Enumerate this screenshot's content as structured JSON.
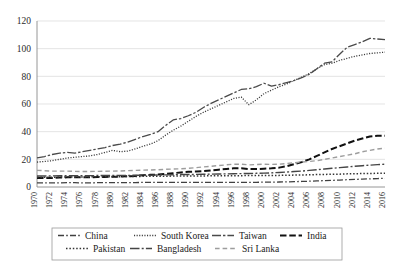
{
  "chart_data": {
    "type": "line",
    "title": "",
    "xlabel": "",
    "ylabel": "",
    "ylim": [
      0,
      120
    ],
    "yticks": [
      0,
      20,
      40,
      60,
      80,
      100,
      120
    ],
    "grid": true,
    "legend_position": "bottom",
    "x": [
      1970,
      1971,
      1972,
      1973,
      1974,
      1975,
      1976,
      1977,
      1978,
      1979,
      1980,
      1981,
      1982,
      1983,
      1984,
      1985,
      1986,
      1987,
      1988,
      1989,
      1990,
      1991,
      1992,
      1993,
      1994,
      1995,
      1996,
      1997,
      1998,
      1999,
      2000,
      2001,
      2002,
      2003,
      2004,
      2005,
      2006,
      2007,
      2008,
      2009,
      2010,
      2011,
      2012,
      2013,
      2014,
      2015,
      2016
    ],
    "xtick_labels": [
      "1970",
      "1972",
      "1974",
      "1976",
      "1978",
      "1980",
      "1982",
      "1984",
      "1986",
      "1988",
      "1990",
      "1992",
      "1994",
      "1996",
      "1998",
      "2000",
      "2002",
      "2004",
      "2006",
      "2008",
      "2010",
      "2012",
      "2014",
      "2016"
    ],
    "xtick_rotation": 90,
    "series": [
      {
        "name": "China",
        "style": "dash-dot",
        "color": "#404040",
        "width": 1.3,
        "values": [
          3.0,
          3.0,
          3.0,
          3.0,
          3.1,
          3.1,
          3.0,
          3.0,
          3.1,
          3.1,
          3.2,
          3.2,
          3.2,
          3.2,
          3.3,
          3.3,
          3.3,
          3.3,
          3.3,
          3.3,
          3.3,
          3.3,
          3.3,
          3.3,
          3.4,
          3.4,
          3.4,
          3.4,
          3.4,
          3.4,
          3.5,
          3.5,
          3.6,
          3.7,
          3.9,
          4.0,
          4.2,
          4.4,
          4.6,
          4.8,
          5.0,
          5.3,
          5.5,
          5.7,
          5.9,
          6.1,
          6.3
        ]
      },
      {
        "name": "South Korea",
        "style": "fine-dotted",
        "color": "#3a3a3a",
        "width": 1.3,
        "values": [
          18.0,
          18.5,
          19.0,
          20.0,
          21.0,
          21.5,
          22.0,
          22.5,
          23.5,
          25.0,
          26.5,
          25.5,
          26.0,
          27.5,
          29.5,
          31.0,
          33.5,
          37.5,
          41.0,
          44.0,
          47.5,
          51.0,
          54.0,
          56.5,
          59.0,
          61.5,
          64.0,
          65.0,
          59.5,
          63.0,
          67.5,
          70.0,
          72.5,
          74.5,
          77.0,
          79.5,
          82.0,
          85.5,
          88.5,
          89.5,
          91.5,
          93.0,
          94.5,
          95.5,
          96.5,
          97.0,
          97.5
        ]
      },
      {
        "name": "Taiwan",
        "style": "solid-dash",
        "color": "#4a4a4a",
        "width": 1.3,
        "values": [
          21.0,
          22.0,
          23.5,
          24.5,
          25.0,
          24.5,
          25.5,
          26.5,
          27.5,
          28.5,
          30.0,
          31.0,
          32.5,
          34.5,
          36.5,
          38.0,
          40.0,
          44.5,
          48.5,
          49.5,
          51.5,
          54.0,
          57.5,
          60.5,
          63.0,
          65.5,
          68.0,
          70.5,
          71.0,
          72.5,
          75.0,
          73.0,
          74.0,
          75.5,
          77.0,
          79.0,
          81.5,
          85.5,
          89.5,
          90.5,
          96.0,
          101.0,
          103.0,
          105.0,
          107.5,
          107.0,
          106.5
        ]
      },
      {
        "name": "India",
        "style": "bold-dash",
        "color": "#111111",
        "width": 2.0,
        "values": [
          6.5,
          6.5,
          6.5,
          6.8,
          7.0,
          7.0,
          7.0,
          7.0,
          7.2,
          7.3,
          7.5,
          7.5,
          7.8,
          8.0,
          8.5,
          8.8,
          9.0,
          9.5,
          10.0,
          10.5,
          11.0,
          11.2,
          11.5,
          12.0,
          12.5,
          13.0,
          13.5,
          13.5,
          13.0,
          13.0,
          13.2,
          13.5,
          14.0,
          15.0,
          16.5,
          18.0,
          20.0,
          22.5,
          25.0,
          27.5,
          29.5,
          31.5,
          33.5,
          35.0,
          36.5,
          37.0,
          37.0
        ]
      },
      {
        "name": "Pakistan",
        "style": "dotted",
        "color": "#333333",
        "width": 1.5,
        "values": [
          7.0,
          7.0,
          7.0,
          7.2,
          7.2,
          7.2,
          7.3,
          7.3,
          7.4,
          7.4,
          7.5,
          7.5,
          7.6,
          7.6,
          7.7,
          7.7,
          7.8,
          7.8,
          7.9,
          7.9,
          8.0,
          8.0,
          8.0,
          8.1,
          8.1,
          8.2,
          8.2,
          8.2,
          8.3,
          8.3,
          8.3,
          8.4,
          8.4,
          8.5,
          8.6,
          8.7,
          8.8,
          9.0,
          9.1,
          9.2,
          9.3,
          9.5,
          9.6,
          9.7,
          9.8,
          9.9,
          10.0
        ]
      },
      {
        "name": "Bangladesh",
        "style": "long-dash-dot",
        "color": "#454545",
        "width": 1.4,
        "values": [
          8.0,
          8.0,
          8.0,
          8.1,
          8.1,
          8.2,
          8.2,
          8.2,
          8.3,
          8.3,
          8.4,
          8.4,
          8.4,
          8.5,
          8.5,
          8.6,
          8.7,
          8.8,
          8.9,
          9.0,
          9.0,
          9.1,
          9.2,
          9.3,
          9.4,
          9.5,
          9.6,
          9.7,
          9.8,
          9.9,
          10.0,
          10.2,
          10.5,
          10.8,
          11.2,
          11.5,
          12.0,
          12.5,
          13.0,
          13.5,
          14.0,
          14.5,
          15.0,
          15.4,
          15.8,
          16.2,
          16.5
        ]
      },
      {
        "name": "Sri Lanka",
        "style": "light-dash",
        "color": "#9d9d9d",
        "width": 1.4,
        "values": [
          12.0,
          11.8,
          11.5,
          11.5,
          11.5,
          11.3,
          11.2,
          11.2,
          11.3,
          11.4,
          11.5,
          11.6,
          11.8,
          12.0,
          12.2,
          12.3,
          12.5,
          12.8,
          13.0,
          13.2,
          13.5,
          14.0,
          14.5,
          15.0,
          15.5,
          16.0,
          16.5,
          16.5,
          16.0,
          16.2,
          16.5,
          16.3,
          16.5,
          17.0,
          17.5,
          18.0,
          18.5,
          19.0,
          20.0,
          21.0,
          22.0,
          23.0,
          24.0,
          25.5,
          26.5,
          27.5,
          28.0
        ]
      }
    ]
  },
  "legend": {
    "rows": [
      [
        {
          "label": "China",
          "style": "dash-dot"
        },
        {
          "label": "South Korea",
          "style": "fine-dotted"
        },
        {
          "label": "Taiwan",
          "style": "solid-dash"
        },
        {
          "label": "India",
          "style": "bold-dash"
        }
      ],
      [
        {
          "label": "Pakistan",
          "style": "dotted"
        },
        {
          "label": "Bangladesh",
          "style": "long-dash-dot"
        },
        {
          "label": "Sri Lanka",
          "style": "light-dash"
        }
      ]
    ]
  }
}
